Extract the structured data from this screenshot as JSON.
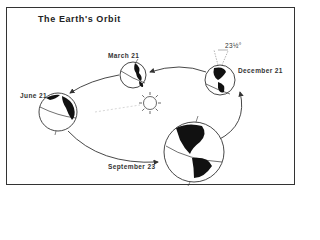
{
  "title": "The Earth's Orbit",
  "labels": {
    "march": "March 21",
    "june": "June 21",
    "september": "September 23",
    "december": "December 21",
    "tilt": "23½°"
  },
  "colors": {
    "line": "#333333",
    "land": "#111111",
    "background": "#ffffff"
  },
  "icons": [
    "sun-icon",
    "earth-globe-icon",
    "orbit-arrow-icon"
  ]
}
